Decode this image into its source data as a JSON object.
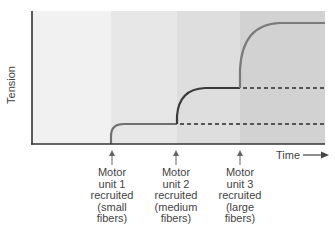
{
  "diagram": {
    "y_axis_label": "Tension",
    "x_axis_label": "Time",
    "x_axis_arrow": "arrow-right-icon",
    "regions": [
      {
        "name": "baseline",
        "color": "#f1f1f1"
      },
      {
        "name": "unit1",
        "color": "#e7e7e7"
      },
      {
        "name": "unit2",
        "color": "#dedede"
      },
      {
        "name": "unit3",
        "color": "#d2d2d2"
      }
    ],
    "annotations": [
      {
        "lines": [
          "Motor",
          "unit 1",
          "recruited",
          "(small",
          "fibers)"
        ]
      },
      {
        "lines": [
          "Motor",
          "unit 2",
          "recruited",
          "(medium",
          "fibers)"
        ]
      },
      {
        "lines": [
          "Motor",
          "unit 3",
          "recruited",
          "(large",
          "fibers)"
        ]
      }
    ],
    "curve_colors": {
      "unit1": "#6f6f6f",
      "unit2": "#3a3a3a",
      "unit3": "#7a7a7a",
      "dashed": "#555555",
      "axis": "#333333"
    }
  }
}
